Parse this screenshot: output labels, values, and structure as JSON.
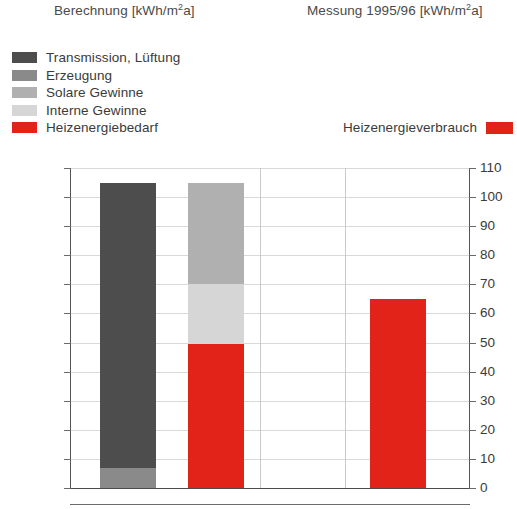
{
  "headers": {
    "left": "Berechnung [kWh/m",
    "left_sup": "2",
    "left_tail": "a]",
    "right": "Messung 1995/96 [kWh/m",
    "right_sup": "2",
    "right_tail": "a]"
  },
  "legend_left": {
    "items": [
      {
        "label": "Transmission, Lüftung",
        "color": "#4d4d4d"
      },
      {
        "label": "Erzeugung",
        "color": "#8a8a8a"
      },
      {
        "label": "Solare Gewinne",
        "color": "#b0b0b0"
      },
      {
        "label": "Interne Gewinne",
        "color": "#d6d6d6"
      },
      {
        "label": "Heizenergiebedarf",
        "color": "#e2231a"
      }
    ]
  },
  "legend_right": {
    "label": "Heizenergieverbrauch",
    "color": "#e2231a"
  },
  "axes": {
    "y_ticks": [
      110,
      100,
      90,
      80,
      70,
      60,
      50,
      40,
      30,
      20,
      10,
      0
    ],
    "y_min": 0,
    "y_max": 110
  },
  "chart_data": {
    "type": "bar",
    "title": "",
    "subtitle": "",
    "xlabel": "",
    "ylabel": "kWh/m2a",
    "ylim": [
      0,
      110
    ],
    "grid": true,
    "legend_position": "top-left",
    "panels": [
      {
        "name": "Berechnung [kWh/m2a]",
        "title_text": "Berechnung [kWh/m2a]"
      },
      {
        "name": "Messung 1995/96 [kWh/m2a]",
        "title_text": "Messung 1995/96 [kWh/m2a]"
      }
    ],
    "categories": [
      "Verluste (Berechnung)",
      "Gewinne + Bedarf (Berechnung)",
      "Messung 1995/96"
    ],
    "series": [
      {
        "name": "Transmission, Lüftung",
        "color": "#4d4d4d",
        "values": [
          98,
          null,
          null
        ]
      },
      {
        "name": "Erzeugung",
        "color": "#8a8a8a",
        "values": [
          7,
          null,
          null
        ]
      },
      {
        "name": "Solare Gewinne",
        "color": "#b0b0b0",
        "values": [
          null,
          35,
          null
        ]
      },
      {
        "name": "Interne Gewinne",
        "color": "#d6d6d6",
        "values": [
          null,
          20.5,
          null
        ]
      },
      {
        "name": "Heizenergiebedarf",
        "color": "#e2231a",
        "values": [
          null,
          49.5,
          null
        ]
      },
      {
        "name": "Heizenergieverbrauch",
        "color": "#e2231a",
        "values": [
          null,
          null,
          65
        ]
      }
    ],
    "bar_totals": [
      105,
      105,
      65
    ],
    "bars": [
      {
        "name": "bar-berechnung-verluste",
        "total": 105,
        "x_pct": 7.5,
        "width_pct": 14,
        "segments": [
          {
            "label": "Erzeugung",
            "from": 0,
            "to": 7,
            "value": 7,
            "color": "#8a8a8a"
          },
          {
            "label": "Transmission, Lüftung",
            "from": 7,
            "to": 105,
            "value": 98,
            "color": "#4d4d4d"
          }
        ]
      },
      {
        "name": "bar-berechnung-gewinne",
        "total": 105,
        "x_pct": 29.5,
        "width_pct": 14,
        "segments": [
          {
            "label": "Heizenergiebedarf",
            "from": 0,
            "to": 49.5,
            "value": 49.5,
            "color": "#e2231a"
          },
          {
            "label": "Interne Gewinne",
            "from": 49.5,
            "to": 70,
            "value": 20.5,
            "color": "#d6d6d6"
          },
          {
            "label": "Solare Gewinne",
            "from": 70,
            "to": 105,
            "value": 35,
            "color": "#b0b0b0"
          }
        ]
      },
      {
        "name": "bar-messung-verbrauch",
        "total": 65,
        "x_pct": 75,
        "width_pct": 14,
        "segments": [
          {
            "label": "Heizenergieverbrauch",
            "from": 0,
            "to": 65,
            "value": 65,
            "color": "#e2231a"
          }
        ]
      }
    ]
  }
}
